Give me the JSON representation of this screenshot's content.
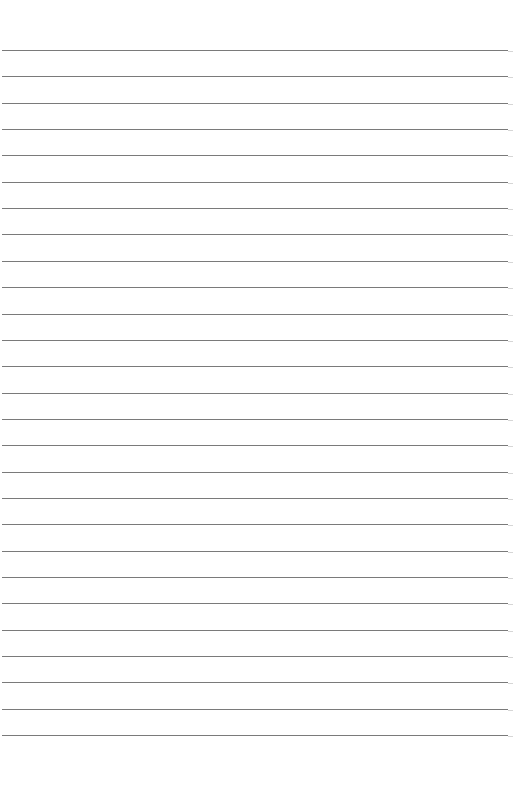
{
  "page": {
    "type": "lined-paper",
    "background": "#ffffff",
    "rule_color": "#7a7a7a",
    "rule_count": 27,
    "first_rule_y": 50,
    "rule_spacing": 26.35
  }
}
